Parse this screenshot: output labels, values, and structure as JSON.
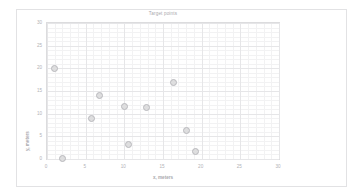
{
  "chart_data": {
    "type": "scatter",
    "title": "Target points",
    "xlabel": "x, meters",
    "ylabel": "y, meters",
    "xlim": [
      0,
      30
    ],
    "ylim": [
      0,
      30
    ],
    "xticks": [
      "0",
      "5",
      "10",
      "15",
      "20",
      "25",
      "30"
    ],
    "yticks": [
      "0",
      "5",
      "10",
      "15",
      "20",
      "25",
      "30"
    ],
    "xtick_values": [
      0,
      5,
      10,
      15,
      20,
      25,
      30
    ],
    "ytick_values": [
      0,
      5,
      10,
      15,
      20,
      25,
      30
    ],
    "grid": true,
    "legend": null,
    "marker_color": "#b9b9bd",
    "marker_fill": "#dededf",
    "series": [
      {
        "name": "Target points",
        "points": [
          {
            "x": 1.0,
            "y": 20.0
          },
          {
            "x": 2.0,
            "y": 0.1
          },
          {
            "x": 5.8,
            "y": 8.9
          },
          {
            "x": 6.8,
            "y": 14.0
          },
          {
            "x": 10.0,
            "y": 11.5
          },
          {
            "x": 10.5,
            "y": 3.2
          },
          {
            "x": 12.9,
            "y": 11.4
          },
          {
            "x": 16.4,
            "y": 16.9
          },
          {
            "x": 18.0,
            "y": 6.3
          },
          {
            "x": 19.2,
            "y": 1.7
          }
        ]
      }
    ]
  }
}
